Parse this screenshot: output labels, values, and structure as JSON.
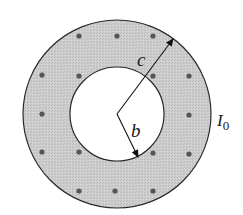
{
  "diagram": {
    "labels": {
      "outer_radius": "c",
      "inner_radius": "b",
      "current": "I",
      "current_subscript": "0"
    },
    "geometry": {
      "center": [
        117,
        114
      ],
      "outer_radius_px": 94,
      "inner_radius_px": 47
    },
    "colors": {
      "fill": "#c9c9c9",
      "stroke": "#2a2a2a",
      "dot": "#555555",
      "hole": "#ffffff"
    },
    "dots": [
      [
        79,
        36
      ],
      [
        117,
        36
      ],
      [
        153,
        36
      ],
      [
        42,
        75
      ],
      [
        79,
        76
      ],
      [
        153,
        76
      ],
      [
        189,
        76
      ],
      [
        42,
        114
      ],
      [
        189,
        115
      ],
      [
        42,
        152
      ],
      [
        79,
        152
      ],
      [
        153,
        153
      ],
      [
        189,
        154
      ],
      [
        79,
        191
      ],
      [
        115,
        191
      ],
      [
        153,
        191
      ]
    ]
  }
}
